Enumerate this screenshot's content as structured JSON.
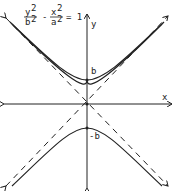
{
  "equation": {
    "num1": "y",
    "exp1": "2",
    "den1": "b",
    "dexp1": "2",
    "minus": "-",
    "num2": "x",
    "exp2": "2",
    "den2": "a",
    "dexp2": "2",
    "equals": "= 1"
  },
  "axes": {
    "x_label": "x",
    "y_label": "y"
  },
  "vertices": {
    "top": "b",
    "bottom": "-b"
  },
  "colors": {
    "line": "#222222",
    "background": "#ffffff"
  }
}
